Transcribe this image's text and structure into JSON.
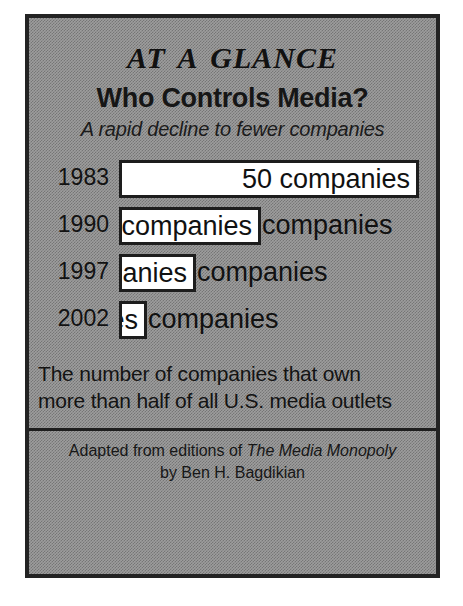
{
  "poster": {
    "kicker": "At a Glance",
    "headline": "Who Controls Media?",
    "tagline": "A rapid decline to fewer companies",
    "unit_word": "companies",
    "caption_line1": "The number of companies that own",
    "caption_line2": "more than half of all U.S. media outlets",
    "credit_prefix": "Adapted from editions of",
    "credit_title": "The Media Monopoly",
    "credit_author": "by Ben H. Bagdikian",
    "frame_color": "#232323",
    "background_color": "#9d9d9d",
    "bar_fill_color": "#ffffff",
    "bar_border_color": "#1d1d1d"
  },
  "chart_data": {
    "type": "bar",
    "title": "Who Controls Media?",
    "subtitle": "A rapid decline to fewer companies",
    "xlabel": "",
    "ylabel": "",
    "orientation": "horizontal",
    "grid": false,
    "legend": false,
    "value_suffix": "companies",
    "categories": [
      "1983",
      "1990",
      "1997",
      "2002"
    ],
    "values": [
      50,
      23,
      10,
      6
    ],
    "xlim": [
      0,
      50
    ],
    "bars": [
      {
        "year": "1983",
        "value": 50,
        "label": "50 companies",
        "value_text": "50",
        "bar_px": 300,
        "text_inside": true,
        "outside_text": ""
      },
      {
        "year": "1990",
        "value": 23,
        "label": "23 companies",
        "value_text": "23",
        "bar_px": 142,
        "text_inside": false,
        "outside_text": "companies"
      },
      {
        "year": "1997",
        "value": 10,
        "label": "10 companies",
        "value_text": "10",
        "bar_px": 77,
        "text_inside": false,
        "outside_text": "companies"
      },
      {
        "year": "2002",
        "value": 6,
        "label": "6 companies",
        "value_text": "6",
        "bar_px": 28,
        "text_inside": false,
        "outside_text": "companies"
      }
    ]
  }
}
